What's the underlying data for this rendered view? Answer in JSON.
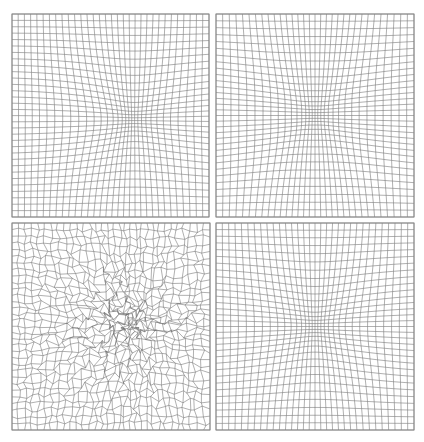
{
  "figure": {
    "background": "#ffffff",
    "line_color": "#6e6e6e",
    "frame_color": "#8a8a8a",
    "line_width": 0.55,
    "grid_n": 32,
    "panels": [
      {
        "id": "top-left",
        "description": "structured mesh refined toward an off-center elliptical region (right of center)",
        "box": {
          "x": 12,
          "y": 14,
          "w": 197,
          "h": 203
        },
        "center": [
          0.62,
          0.52
        ],
        "radius": [
          0.22,
          0.2
        ],
        "strength": 0.62,
        "squareness": 2.0,
        "noise": 0.0,
        "seed": 1
      },
      {
        "id": "top-right",
        "description": "structured mesh refined toward a centered rounded-square region",
        "box": {
          "x": 216,
          "y": 14,
          "w": 198,
          "h": 203
        },
        "center": [
          0.5,
          0.5
        ],
        "radius": [
          0.24,
          0.22
        ],
        "strength": 0.62,
        "squareness": 4.0,
        "noise": 0.0,
        "seed": 2
      },
      {
        "id": "bottom-left",
        "description": "tangled / distorted mesh with heavy clustering along the right edge",
        "box": {
          "x": 12,
          "y": 223,
          "w": 198,
          "h": 207
        },
        "center": [
          0.62,
          0.48
        ],
        "radius": [
          0.26,
          0.24
        ],
        "strength": 0.55,
        "squareness": 2.0,
        "noise": 0.045,
        "seed": 7
      },
      {
        "id": "bottom-right",
        "description": "structured mesh refined toward a centered circular region",
        "box": {
          "x": 216,
          "y": 223,
          "w": 198,
          "h": 207
        },
        "center": [
          0.5,
          0.5
        ],
        "radius": [
          0.23,
          0.21
        ],
        "strength": 0.62,
        "squareness": 2.0,
        "noise": 0.0,
        "seed": 3
      }
    ]
  }
}
